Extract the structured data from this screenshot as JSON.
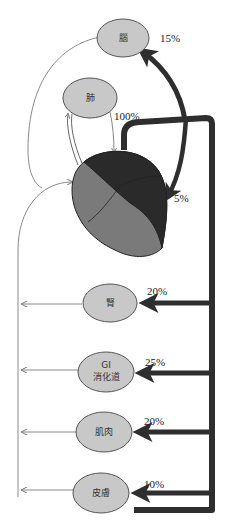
{
  "diagram": {
    "title": "",
    "colors": {
      "organ_fill": "#c8c8c8",
      "organ_stroke": "#555555",
      "artery": "#2e2e2e",
      "vein": "#8a8a8a",
      "heart_light": "#7a7a7a",
      "heart_dark": "#2a2a2a"
    },
    "organs": [
      {
        "id": "brain",
        "label": "腦",
        "percent": "15%"
      },
      {
        "id": "lung",
        "label": "肺",
        "percent": "100%"
      },
      {
        "id": "heart",
        "label": "",
        "percent": "5%"
      },
      {
        "id": "kidney",
        "label": "腎",
        "percent": "20%"
      },
      {
        "id": "gi",
        "label_line1": "GI",
        "label_line2": "消化道",
        "percent": "25%"
      },
      {
        "id": "muscle",
        "label": "肌肉",
        "percent": "20%"
      },
      {
        "id": "skin",
        "label": "皮膚",
        "percent": "10%"
      }
    ]
  }
}
